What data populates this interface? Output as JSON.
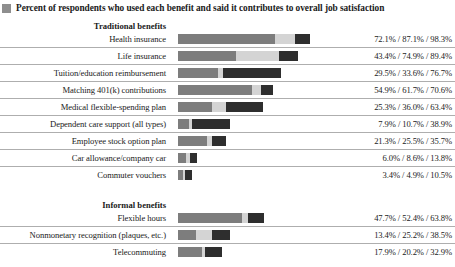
{
  "legend": {
    "swatch_icon": "legend-square-icon",
    "label": "Percent of respondents who used each benefit and said it contributes to overall job satisfaction",
    "swatch_color": "#8e8e8e"
  },
  "colors": {
    "segment_1": "#7d7d7d",
    "segment_2": "#d4d4d4",
    "segment_3": "#2e2e2e",
    "rule": "#aeaeae"
  },
  "chart_data": {
    "type": "bar",
    "orientation": "horizontal",
    "stacked": false,
    "title": "Percent of respondents who used each benefit and said it contributes to overall job satisfaction",
    "xlabel": "",
    "ylabel": "",
    "xlim": [
      0,
      100
    ],
    "grid": false,
    "legend_position": "top-left",
    "series": [
      {
        "name": "value_1",
        "color": "#7d7d7d"
      },
      {
        "name": "value_2",
        "color": "#d4d4d4"
      },
      {
        "name": "value_3",
        "color": "#2e2e2e"
      }
    ],
    "groups": [
      {
        "title": "Traditional benefits",
        "rows": [
          {
            "category": "Health insurance",
            "values": [
              72.1,
              87.1,
              98.3
            ],
            "value_text": "72.1% / 87.1% / 98.3%"
          },
          {
            "category": "Life insurance",
            "values": [
              43.4,
              74.9,
              89.4
            ],
            "value_text": "43.4% / 74.9% / 89.4%"
          },
          {
            "category": "Tuition/education reimbursement",
            "values": [
              29.5,
              33.6,
              76.7
            ],
            "value_text": "29.5% / 33.6% / 76.7%"
          },
          {
            "category": "Matching 401(k) contributions",
            "values": [
              54.9,
              61.7,
              70.6
            ],
            "value_text": "54.9% / 61.7% / 70.6%"
          },
          {
            "category": "Medical flexible-spending plan",
            "values": [
              25.3,
              36.0,
              63.4
            ],
            "value_text": "25.3% / 36.0% / 63.4%"
          },
          {
            "category": "Dependent care support (all types)",
            "values": [
              7.9,
              10.7,
              38.9
            ],
            "value_text": "7.9% / 10.7% / 38.9%"
          },
          {
            "category": "Employee stock option plan",
            "values": [
              21.3,
              25.5,
              35.7
            ],
            "value_text": "21.3% / 25.5% / 35.7%"
          },
          {
            "category": "Car allowance/company car",
            "values": [
              6.0,
              8.6,
              13.8
            ],
            "value_text": "6.0% / 8.6% / 13.8%"
          },
          {
            "category": "Commuter vouchers",
            "values": [
              3.4,
              4.9,
              10.5
            ],
            "value_text": "3.4% / 4.9% / 10.5%"
          }
        ]
      },
      {
        "title": "Informal benefits",
        "rows": [
          {
            "category": "Flexible hours",
            "values": [
              47.7,
              52.4,
              63.8
            ],
            "value_text": "47.7% / 52.4% / 63.8%"
          },
          {
            "category": "Nonmonetary recognition (plaques, etc.)",
            "values": [
              13.4,
              25.2,
              38.5
            ],
            "value_text": "13.4% / 25.2% / 38.5%"
          },
          {
            "category": "Telecommuting",
            "values": [
              17.9,
              20.2,
              32.9
            ],
            "value_text": "17.9% / 20.2% / 32.9%"
          }
        ]
      }
    ]
  }
}
